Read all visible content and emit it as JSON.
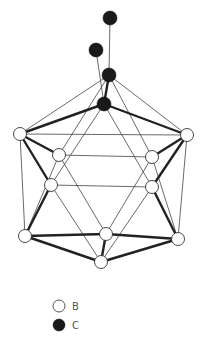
{
  "diagram": {
    "nodes": [
      {
        "id": "c_top",
        "type": "C",
        "x": 110,
        "y": 18
      },
      {
        "id": "c_side",
        "type": "C",
        "x": 96,
        "y": 50
      },
      {
        "id": "c_cage_upper",
        "type": "C",
        "x": 109,
        "y": 75
      },
      {
        "id": "c_cage_lower",
        "type": "C",
        "x": 104,
        "y": 104
      },
      {
        "id": "b_left_outer",
        "type": "B",
        "x": 20,
        "y": 134
      },
      {
        "id": "b_right_outer",
        "type": "B",
        "x": 187,
        "y": 135
      },
      {
        "id": "b_left_upper",
        "type": "B",
        "x": 59,
        "y": 155
      },
      {
        "id": "b_right_upper",
        "type": "B",
        "x": 152,
        "y": 157
      },
      {
        "id": "b_left_mid",
        "type": "B",
        "x": 51,
        "y": 185
      },
      {
        "id": "b_right_mid",
        "type": "B",
        "x": 152,
        "y": 187
      },
      {
        "id": "b_left_low",
        "type": "B",
        "x": 25,
        "y": 236
      },
      {
        "id": "b_center_low",
        "type": "B",
        "x": 106,
        "y": 234
      },
      {
        "id": "b_right_low",
        "type": "B",
        "x": 178,
        "y": 239
      },
      {
        "id": "b_bottom",
        "type": "B",
        "x": 101,
        "y": 262
      }
    ],
    "legend": [
      {
        "symbol": "open-circle",
        "label": "B"
      },
      {
        "symbol": "filled-circle",
        "label": "C"
      }
    ]
  }
}
